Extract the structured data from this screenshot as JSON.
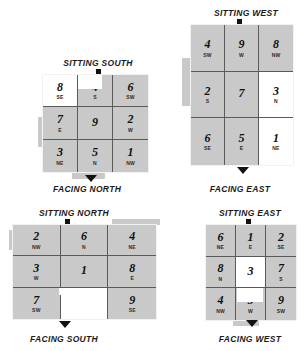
{
  "page": {
    "background_color": "#ffffff",
    "cell_fill_color": "#c9c9c9",
    "cell_white_color": "#ffffff",
    "grid_line_color": "#5a5a5a",
    "text_color": "#101010"
  },
  "diagrams": [
    {
      "id": "sitting-south",
      "title": "SITTING SOUTH",
      "caption": "FACING NORTH",
      "rows": [
        [
          {
            "num": "8",
            "sub": "SE",
            "fill": "white"
          },
          {
            "num": "4",
            "sub": "S",
            "fill": "grey"
          },
          {
            "num": "6",
            "sub": "SW",
            "fill": "grey"
          }
        ],
        [
          {
            "num": "7",
            "sub": "E",
            "fill": "grey"
          },
          {
            "num": "9",
            "sub": "",
            "fill": "grey"
          },
          {
            "num": "2",
            "sub": "W",
            "fill": "grey"
          }
        ],
        [
          {
            "num": "3",
            "sub": "NE",
            "fill": "grey"
          },
          {
            "num": "5",
            "sub": "N",
            "fill": "grey"
          },
          {
            "num": "1",
            "sub": "NW",
            "fill": "grey"
          }
        ]
      ]
    },
    {
      "id": "sitting-west",
      "title": "SITTING WEST",
      "caption": "FACING EAST",
      "rows": [
        [
          {
            "num": "4",
            "sub": "SW",
            "fill": "grey"
          },
          {
            "num": "9",
            "sub": "W",
            "fill": "grey"
          },
          {
            "num": "8",
            "sub": "NW",
            "fill": "grey"
          }
        ],
        [
          {
            "num": "2",
            "sub": "S",
            "fill": "grey"
          },
          {
            "num": "7",
            "sub": "",
            "fill": "grey"
          },
          {
            "num": "3",
            "sub": "N",
            "fill": "white"
          }
        ],
        [
          {
            "num": "6",
            "sub": "SE",
            "fill": "grey"
          },
          {
            "num": "5",
            "sub": "E",
            "fill": "grey"
          },
          {
            "num": "1",
            "sub": "NE",
            "fill": "white"
          }
        ]
      ]
    },
    {
      "id": "sitting-north",
      "title": "SITTING NORTH",
      "caption": "FACING SOUTH",
      "rows": [
        [
          {
            "num": "2",
            "sub": "NW",
            "fill": "grey"
          },
          {
            "num": "6",
            "sub": "N",
            "fill": "grey"
          },
          {
            "num": "4",
            "sub": "NE",
            "fill": "grey"
          }
        ],
        [
          {
            "num": "3",
            "sub": "W",
            "fill": "grey"
          },
          {
            "num": "1",
            "sub": "",
            "fill": "grey"
          },
          {
            "num": "8",
            "sub": "E",
            "fill": "grey"
          }
        ],
        [
          {
            "num": "7",
            "sub": "SW",
            "fill": "grey"
          },
          {
            "num": "5",
            "sub": "S",
            "fill": "white"
          },
          {
            "num": "9",
            "sub": "SE",
            "fill": "grey"
          }
        ]
      ]
    },
    {
      "id": "sitting-east",
      "title": "SITTING EAST",
      "caption": "FACING WEST",
      "rows": [
        [
          {
            "num": "6",
            "sub": "NE",
            "fill": "grey"
          },
          {
            "num": "1",
            "sub": "E",
            "fill": "grey"
          },
          {
            "num": "2",
            "sub": "SE",
            "fill": "grey"
          }
        ],
        [
          {
            "num": "8",
            "sub": "N",
            "fill": "grey"
          },
          {
            "num": "3",
            "sub": "",
            "fill": "white"
          },
          {
            "num": "7",
            "sub": "S",
            "fill": "grey"
          }
        ],
        [
          {
            "num": "4",
            "sub": "NW",
            "fill": "grey"
          },
          {
            "num": "5",
            "sub": "W",
            "fill": "grey"
          },
          {
            "num": "9",
            "sub": "SW",
            "fill": "grey"
          }
        ]
      ]
    }
  ]
}
